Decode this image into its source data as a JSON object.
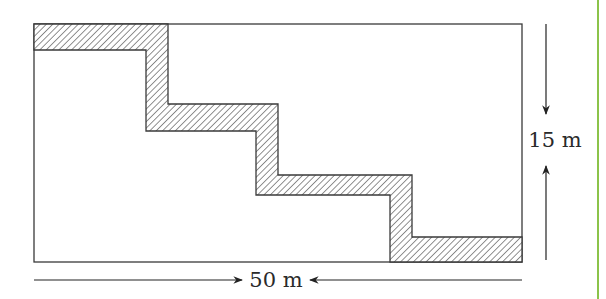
{
  "diagram": {
    "dimensions": {
      "width_label": "50 m",
      "height_label": "15 m"
    },
    "colors": {
      "outline": "#3a3a3a",
      "hatch": "#555555",
      "fill": "#ffffff",
      "side_rule": "#8bc34a"
    }
  }
}
